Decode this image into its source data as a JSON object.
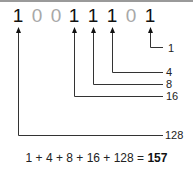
{
  "binary": {
    "digits": [
      "1",
      "0",
      "0",
      "1",
      "1",
      "1",
      "0",
      "1"
    ],
    "digit_colors": {
      "one": "#111111",
      "zero": "#a8a8a8"
    }
  },
  "labels": {
    "bit0": "1",
    "bit2": "4",
    "bit3": "8",
    "bit4": "16",
    "bit7": "128"
  },
  "equation": {
    "expression": "1 + 4 + 8 + 16 + 128 = ",
    "result": "157"
  }
}
